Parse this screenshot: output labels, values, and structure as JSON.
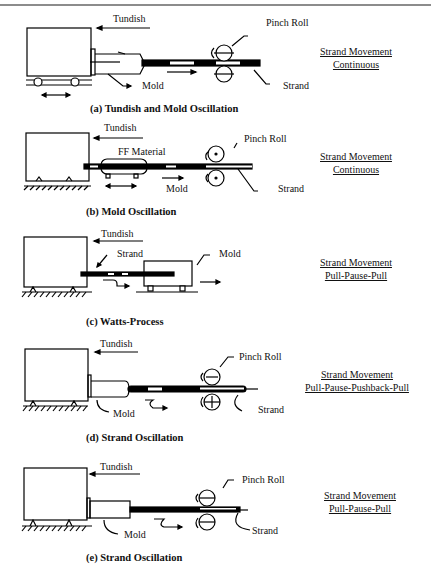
{
  "figure": {
    "panels": [
      {
        "id": "a",
        "caption": "(a) Tundish and Mold Oscillation",
        "labels": {
          "tundish": "Tundish",
          "pinch_roll": "Pinch Roll",
          "mold": "Mold",
          "strand": "Strand"
        },
        "movement": {
          "title": "Strand Movement",
          "mode": "Continuous"
        }
      },
      {
        "id": "b",
        "caption": "(b) Mold Oscillation",
        "labels": {
          "tundish": "Tundish",
          "pinch_roll": "Pinch Roll",
          "ff_material": "FF Material",
          "mold": "Mold",
          "strand": "Strand"
        },
        "movement": {
          "title": "Strand Movement",
          "mode": "Continuous"
        }
      },
      {
        "id": "c",
        "caption": "(c) Watts-Process",
        "labels": {
          "tundish": "Tundish",
          "strand": "Strand",
          "mold": "Mold"
        },
        "movement": {
          "title": "Strand Movement",
          "mode": "Pull-Pause-Pull"
        }
      },
      {
        "id": "d",
        "caption": "(d) Strand Oscillation",
        "labels": {
          "tundish": "Tundish",
          "pinch_roll": "Pinch Roll",
          "mold": "Mold",
          "strand": "Strand"
        },
        "movement": {
          "title": "Strand Movement",
          "mode": "Pull-Pause-Pushback-Pull"
        }
      },
      {
        "id": "e",
        "caption": "(e) Strand Oscillation",
        "labels": {
          "tundish": "Tundish",
          "pinch_roll": "Pinch Roll",
          "mold": "Mold",
          "strand": "Strand"
        },
        "movement": {
          "title": "Strand Movement",
          "mode": "Pull-Pause-Pull"
        }
      }
    ]
  }
}
